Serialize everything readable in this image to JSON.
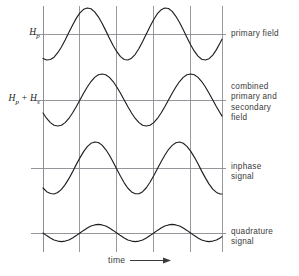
{
  "figure": {
    "left_labels": [
      {
        "name": "primary-field-symbol",
        "base": "H",
        "sub": "p",
        "text": "Hp"
      },
      {
        "name": "combined-field-symbol",
        "base": "H",
        "sub": "p",
        "base2": "H",
        "sub2": "s",
        "plus": "+",
        "text": "Hp + Hs"
      }
    ],
    "right_labels": {
      "primary": "primary field",
      "combined": "combined\nprimary and\nsecondary\nfield",
      "inphase": "inphase\nsignal",
      "quadrature": "quadrature\nsignal"
    },
    "axis": {
      "time_label": "time",
      "arrow_icon": "right-arrow-icon"
    },
    "colors": {
      "curve": "#1f1f1f",
      "grid": "#8d8d93",
      "baseline": "#8a8a90",
      "background": "#ffffff",
      "text": "#3a3a3a"
    }
  },
  "chart_data": {
    "type": "line",
    "title": "",
    "xlabel": "time",
    "ylabel": "",
    "grid": true,
    "legend_position": "right",
    "x_gridlines": [
      0,
      1,
      2,
      3,
      4
    ],
    "x_range": [
      0,
      4.85
    ],
    "series": [
      {
        "name": "primary field",
        "symbol": "Hp",
        "baseline_label": "Hp",
        "amplitude": 1.0,
        "period": 2.0,
        "phase_deg": -110,
        "x": [
          0.0,
          0.1,
          0.2,
          0.3,
          0.4,
          0.5,
          0.6,
          0.7,
          0.8,
          0.9,
          1.0,
          1.1,
          1.2,
          1.3,
          1.4,
          1.5,
          1.6,
          1.7,
          1.8,
          1.9,
          2.0,
          2.1,
          2.2,
          2.3,
          2.4,
          2.5,
          2.6,
          2.7,
          2.8,
          2.9,
          3.0,
          3.1,
          3.2,
          3.3,
          3.4,
          3.5,
          3.6,
          3.7,
          3.8,
          3.9,
          4.0,
          4.1,
          4.2,
          4.3,
          4.4,
          4.5,
          4.6,
          4.7,
          4.8,
          4.85
        ],
        "values": [
          -0.94,
          -1.0,
          -0.98,
          -0.89,
          -0.72,
          -0.5,
          -0.23,
          0.06,
          0.34,
          0.6,
          0.81,
          0.95,
          1.0,
          0.97,
          0.85,
          0.66,
          0.41,
          0.13,
          -0.16,
          -0.44,
          -0.68,
          -0.87,
          -0.98,
          -1.0,
          -0.93,
          -0.78,
          -0.56,
          -0.29,
          0.0,
          0.29,
          0.56,
          0.78,
          0.93,
          1.0,
          0.98,
          0.87,
          0.68,
          0.44,
          0.16,
          -0.13,
          -0.41,
          -0.66,
          -0.85,
          -0.97,
          -1.0,
          -0.95,
          -0.81,
          -0.6,
          -0.34,
          -0.2
        ]
      },
      {
        "name": "combined primary and secondary field",
        "symbol": "Hp + Hs",
        "baseline_label": "Hp + Hs",
        "amplitude": 1.0,
        "period": 2.0,
        "phase_deg": -150,
        "x": [
          0.0,
          0.1,
          0.2,
          0.3,
          0.4,
          0.5,
          0.6,
          0.7,
          0.8,
          0.9,
          1.0,
          1.1,
          1.2,
          1.3,
          1.4,
          1.5,
          1.6,
          1.7,
          1.8,
          1.9,
          2.0,
          2.1,
          2.2,
          2.3,
          2.4,
          2.5,
          2.6,
          2.7,
          2.8,
          2.9,
          3.0,
          3.1,
          3.2,
          3.3,
          3.4,
          3.5,
          3.6,
          3.7,
          3.8,
          3.9,
          4.0,
          4.1,
          4.2,
          4.3,
          4.4,
          4.5,
          4.6,
          4.7,
          4.8,
          4.85
        ],
        "values": [
          -0.5,
          -0.71,
          -0.87,
          -0.97,
          -1.0,
          -0.97,
          -0.87,
          -0.71,
          -0.5,
          -0.26,
          0.0,
          0.26,
          0.5,
          0.71,
          0.87,
          0.97,
          1.0,
          0.97,
          0.87,
          0.71,
          0.5,
          0.26,
          0.0,
          -0.26,
          -0.5,
          -0.71,
          -0.87,
          -0.97,
          -1.0,
          -0.97,
          -0.87,
          -0.71,
          -0.5,
          -0.26,
          0.0,
          0.26,
          0.5,
          0.71,
          0.87,
          0.97,
          1.0,
          0.97,
          0.87,
          0.71,
          0.5,
          0.26,
          0.0,
          -0.26,
          -0.5,
          -0.62
        ]
      },
      {
        "name": "inphase signal",
        "symbol": "",
        "baseline_label": "",
        "amplitude": 1.0,
        "period": 2.0,
        "phase_deg": -130,
        "x": [
          0.0,
          0.1,
          0.2,
          0.3,
          0.4,
          0.5,
          0.6,
          0.7,
          0.8,
          0.9,
          1.0,
          1.1,
          1.2,
          1.3,
          1.4,
          1.5,
          1.6,
          1.7,
          1.8,
          1.9,
          2.0,
          2.1,
          2.2,
          2.3,
          2.4,
          2.5,
          2.6,
          2.7,
          2.8,
          2.9,
          3.0,
          3.1,
          3.2,
          3.3,
          3.4,
          3.5,
          3.6,
          3.7,
          3.8,
          3.9,
          4.0,
          4.1,
          4.2,
          4.3,
          4.4,
          4.5,
          4.6,
          4.7,
          4.8,
          4.85
        ],
        "values": [
          -0.77,
          -0.91,
          -0.98,
          -1.0,
          -0.94,
          -0.82,
          -0.64,
          -0.41,
          -0.15,
          0.13,
          0.39,
          0.63,
          0.82,
          0.95,
          1.0,
          0.98,
          0.88,
          0.71,
          0.49,
          0.23,
          -0.05,
          -0.32,
          -0.57,
          -0.78,
          -0.92,
          -0.99,
          -0.99,
          -0.91,
          -0.76,
          -0.55,
          -0.3,
          -0.03,
          0.24,
          0.49,
          0.71,
          0.87,
          0.97,
          1.0,
          0.95,
          0.83,
          0.65,
          0.42,
          0.16,
          -0.12,
          -0.38,
          -0.62,
          -0.81,
          -0.94,
          -1.0,
          -1.0
        ]
      },
      {
        "name": "quadrature signal",
        "symbol": "",
        "baseline_label": "",
        "amplitude": 0.33,
        "period": 2.0,
        "phase_deg": 180,
        "x": [
          0.0,
          0.1,
          0.2,
          0.3,
          0.4,
          0.5,
          0.6,
          0.7,
          0.8,
          0.9,
          1.0,
          1.1,
          1.2,
          1.3,
          1.4,
          1.5,
          1.6,
          1.7,
          1.8,
          1.9,
          2.0,
          2.1,
          2.2,
          2.3,
          2.4,
          2.5,
          2.6,
          2.7,
          2.8,
          2.9,
          3.0,
          3.1,
          3.2,
          3.3,
          3.4,
          3.5,
          3.6,
          3.7,
          3.8,
          3.9,
          4.0,
          4.1,
          4.2,
          4.3,
          4.4,
          4.5,
          4.6,
          4.7,
          4.8,
          4.85
        ],
        "values": [
          0.0,
          -0.1,
          -0.19,
          -0.27,
          -0.31,
          -0.33,
          -0.31,
          -0.27,
          -0.19,
          -0.1,
          0.0,
          0.1,
          0.19,
          0.27,
          0.31,
          0.33,
          0.31,
          0.27,
          0.19,
          0.1,
          0.0,
          -0.1,
          -0.19,
          -0.27,
          -0.31,
          -0.33,
          -0.31,
          -0.27,
          -0.19,
          -0.1,
          0.0,
          0.1,
          0.19,
          0.27,
          0.31,
          0.33,
          0.31,
          0.27,
          0.19,
          0.1,
          0.0,
          -0.1,
          -0.19,
          -0.27,
          -0.31,
          -0.33,
          -0.31,
          -0.27,
          -0.19,
          -0.14
        ]
      }
    ]
  }
}
